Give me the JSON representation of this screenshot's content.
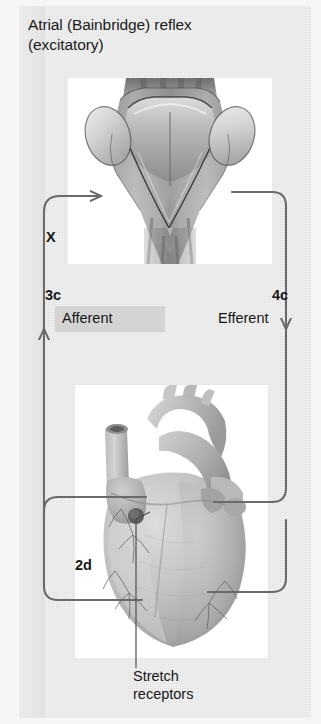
{
  "figure": {
    "title": "Atrial (Bainbridge) reflex\n(excitatory)",
    "title_line1": "Atrial (Bainbridge) reflex",
    "title_line2": "(excitatory)"
  },
  "labels": {
    "vagus_nerve": "X",
    "afferent_node": "3c",
    "afferent": "Afferent",
    "efferent_node": "4c",
    "efferent": "Efferent",
    "receptor_node": "2d"
  },
  "caption": {
    "line1": "Stretch",
    "line2": "receptors"
  },
  "images": {
    "top_plate": "medulla-dorsal-view-illustration",
    "bottom_plate": "heart-anterior-view-illustration"
  },
  "colors": {
    "panel_background": "#e2e2e2",
    "outer_background": "#f6f6f6",
    "plate_background": "#ffffff",
    "line": "#6a6a6a",
    "text": "#171717",
    "afferent_band": "#d4d4d4"
  }
}
